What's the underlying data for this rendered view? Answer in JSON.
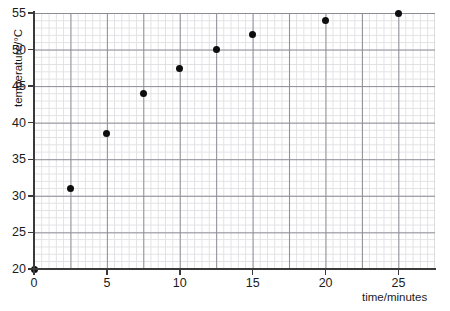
{
  "chart_data": {
    "type": "scatter",
    "title": "",
    "xlabel": "time/minutes",
    "ylabel": "temperature/°C",
    "xlim": [
      0,
      27.5
    ],
    "ylim": [
      20,
      55
    ],
    "grid": true,
    "legend": null,
    "x_ticks": [
      0,
      5,
      10,
      15,
      20,
      25
    ],
    "x_tick_labels": [
      "0",
      "5",
      "10",
      "15",
      "20",
      "25"
    ],
    "y_ticks": [
      20,
      25,
      30,
      35,
      40,
      45,
      50,
      55
    ],
    "y_tick_labels": [
      "20",
      "25",
      "30",
      "35",
      "40",
      "45",
      "50",
      "55"
    ],
    "x": [
      0,
      2.5,
      5,
      7.5,
      10,
      12.5,
      15,
      20,
      25
    ],
    "values": [
      20,
      31,
      38.5,
      44,
      47.4,
      50,
      52,
      54,
      55
    ],
    "points": [
      {
        "x": 0,
        "y": 20
      },
      {
        "x": 2.5,
        "y": 31
      },
      {
        "x": 5,
        "y": 38.5
      },
      {
        "x": 7.5,
        "y": 44
      },
      {
        "x": 10,
        "y": 47.4
      },
      {
        "x": 12.5,
        "y": 50
      },
      {
        "x": 15,
        "y": 52
      },
      {
        "x": 20,
        "y": 54
      },
      {
        "x": 25,
        "y": 55
      }
    ],
    "marker_color": "#0d0d0d",
    "grid_minor_color": "#c9c9cf",
    "grid_major_color": "#6f6f79",
    "axis_color": "#3a3a3a",
    "background_color": "#ffffff"
  }
}
